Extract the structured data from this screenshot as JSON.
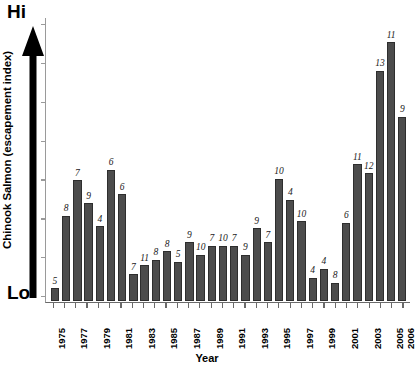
{
  "chart_data": {
    "type": "bar",
    "title": "",
    "xlabel": "Year",
    "ylabel": "Chinook Salmon (escapement index)",
    "y_axis_high_label": "Hi",
    "y_axis_low_label": "Lo",
    "grid": false,
    "legend": "none",
    "y_tick_count": 8,
    "bar_color": "#4c4c4c",
    "bar_edge_color": "#2e2e2e",
    "axis_color": "#6a6a6a",
    "categories": [
      "1975",
      "1976",
      "1977",
      "1978",
      "1979",
      "1980",
      "1981",
      "1982",
      "1983",
      "1984",
      "1985",
      "1986",
      "1987",
      "1988",
      "1989",
      "1990",
      "1991",
      "1992",
      "1993",
      "1994",
      "1995",
      "1996",
      "1997",
      "1998",
      "1999",
      "2000",
      "2001",
      "2002",
      "2003",
      "2004",
      "2005",
      "2006"
    ],
    "tick_labels": [
      "1975",
      "",
      "1977",
      "",
      "1979",
      "",
      "1981",
      "",
      "1983",
      "",
      "1985",
      "",
      "1987",
      "",
      "1989",
      "",
      "1991",
      "",
      "1993",
      "",
      "1995",
      "",
      "1997",
      "",
      "1999",
      "",
      "2001",
      "",
      "2003",
      "",
      "2005",
      "2006"
    ],
    "point_labels": [
      "5",
      "8",
      "7",
      "9",
      "4",
      "6",
      "6",
      "7",
      "11",
      "8",
      "8",
      "5",
      "9",
      "10",
      "7",
      "10",
      "7",
      "9",
      "9",
      "7",
      "10",
      "4",
      "10",
      "4",
      "4",
      "8",
      "6",
      "11",
      "12",
      "13",
      "11",
      "9"
    ],
    "values": [
      7,
      48,
      68,
      55,
      42,
      74,
      60,
      15,
      20,
      23,
      28,
      22,
      33,
      26,
      31,
      31,
      31,
      26,
      41,
      33,
      69,
      57,
      45,
      13,
      18,
      10,
      44,
      77,
      72,
      130,
      146,
      104
    ],
    "ylim": [
      0,
      160
    ],
    "n_bars": 32
  }
}
